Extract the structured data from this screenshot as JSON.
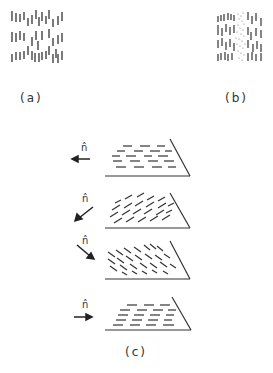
{
  "figure": {
    "panels": [
      {
        "id": "a",
        "label": "(a)",
        "description": "vertical line texture field"
      },
      {
        "id": "b",
        "label": "(b)",
        "description": "vertical line texture with embedded dotted vertical strip"
      },
      {
        "id": "c",
        "label": "(c)",
        "description": "four textured planes with viewing direction arrows"
      }
    ],
    "panel_c_rows": [
      {
        "symbol": "n̂",
        "arrow_direction": "left",
        "texture": "horizontal dashes"
      },
      {
        "symbol": "n̂",
        "arrow_direction": "down-left",
        "texture": "diagonal dashes (rising)"
      },
      {
        "symbol": "n̂",
        "arrow_direction": "down-right",
        "texture": "diagonal dashes (falling)"
      },
      {
        "symbol": "n̂",
        "arrow_direction": "right",
        "texture": "horizontal dashes"
      }
    ],
    "colors": {
      "ink": "#333333",
      "background": "#ffffff"
    }
  }
}
